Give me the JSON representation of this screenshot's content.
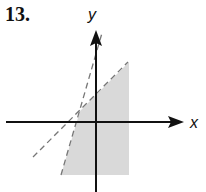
{
  "problem_number": "13.",
  "axes": {
    "x_label": "x",
    "y_label": "y"
  },
  "graph": {
    "type": "linear inequality region",
    "boundary_lines": [
      {
        "style": "dashed",
        "description": "shallow line, slope ~1"
      },
      {
        "style": "dashed",
        "description": "steep line, slope ~3.5"
      }
    ],
    "shaded_region": "above/right of steep line, below shallow line, bounded right"
  },
  "colors": {
    "shade": "#d9d9d9",
    "axis": "#111111",
    "dash": "#777777"
  }
}
